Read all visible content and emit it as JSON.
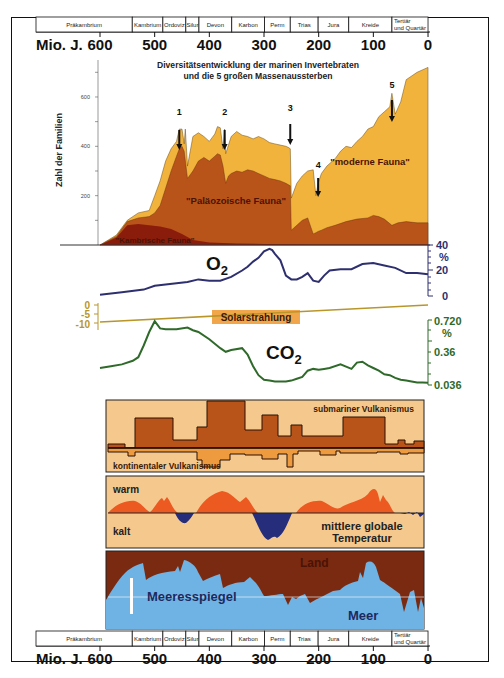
{
  "time_axis": {
    "unit_label": "Mio. J.",
    "ticks": [
      600,
      500,
      400,
      300,
      200,
      100,
      0
    ],
    "periods": [
      {
        "name": "Präkambrium",
        "from": 700,
        "to": 541
      },
      {
        "name": "Kambrium",
        "from": 541,
        "to": 485
      },
      {
        "name": "Ordoviz",
        "from": 485,
        "to": 443
      },
      {
        "name": "Silur",
        "from": 443,
        "to": 419
      },
      {
        "name": "Devon",
        "from": 419,
        "to": 359
      },
      {
        "name": "Karbon",
        "from": 359,
        "to": 299
      },
      {
        "name": "Perm",
        "from": 299,
        "to": 252
      },
      {
        "name": "Trias",
        "from": 252,
        "to": 201
      },
      {
        "name": "Jura",
        "from": 201,
        "to": 145
      },
      {
        "name": "Kreide",
        "from": 145,
        "to": 66
      },
      {
        "name": "Tertiär und Quartär",
        "line1": "Tertiär",
        "line2": "und Quartär",
        "from": 66,
        "to": 0
      }
    ]
  },
  "diversity": {
    "title_line1": "Diversitätsentwicklung der marinen Invertebraten",
    "title_line2": "und die 5 großen Massenaussterben",
    "ylabel": "Zahl der Familien",
    "yticks": [
      200,
      400,
      600
    ],
    "extinctions": [
      {
        "label": "1",
        "age": 444
      },
      {
        "label": "2",
        "age": 372
      },
      {
        "label": "3",
        "age": 252
      },
      {
        "label": "4",
        "age": 201
      },
      {
        "label": "5",
        "age": 66
      }
    ],
    "labels": {
      "cambrian": "\"Kambrische Fauna\"",
      "paleozoic": "\"Paläozoische Fauna\"",
      "modern": "\"moderne Fauna\""
    },
    "colors": {
      "cambrian": "#8a1c0c",
      "paleozoic": "#b8531a",
      "modern": "#f2b33d"
    }
  },
  "chart_data": [
    {
      "type": "area",
      "title": "Diversitätsentwicklung der marinen Invertebraten und die 5 großen Massenaussterben",
      "xlabel": "Mio. J.",
      "ylabel": "Zahl der Familien",
      "xlim": [
        600,
        0
      ],
      "ylim": [
        0,
        750
      ],
      "series": [
        {
          "name": "Kambrische Fauna",
          "x": [
            600,
            570,
            550,
            530,
            510,
            490,
            470,
            450,
            430,
            400,
            350,
            300,
            252,
            200,
            100,
            0
          ],
          "values": [
            0,
            30,
            80,
            85,
            80,
            75,
            65,
            45,
            20,
            10,
            6,
            4,
            3,
            2,
            2,
            2
          ]
        },
        {
          "name": "Kambrische + Paläozoische Fauna",
          "x": [
            600,
            570,
            550,
            530,
            510,
            500,
            490,
            480,
            470,
            460,
            455,
            450,
            446,
            440,
            430,
            420,
            410,
            400,
            390,
            385,
            380,
            375,
            370,
            365,
            360,
            350,
            340,
            330,
            320,
            310,
            300,
            290,
            280,
            270,
            260,
            252,
            250,
            240,
            230,
            220,
            210,
            205,
            201,
            195,
            185,
            170,
            150,
            130,
            110,
            100,
            90,
            80,
            66,
            55,
            40,
            20,
            0
          ],
          "values": [
            0,
            35,
            95,
            110,
            115,
            130,
            160,
            230,
            300,
            360,
            390,
            400,
            380,
            270,
            300,
            340,
            355,
            340,
            360,
            370,
            365,
            320,
            250,
            280,
            290,
            300,
            295,
            305,
            300,
            290,
            280,
            270,
            265,
            260,
            250,
            240,
            60,
            80,
            100,
            110,
            45,
            50,
            55,
            60,
            70,
            80,
            95,
            105,
            110,
            120,
            115,
            105,
            80,
            90,
            95,
            90,
            90
          ]
        },
        {
          "name": "Gesamt (inkl. moderne Fauna)",
          "x": [
            600,
            570,
            550,
            530,
            510,
            500,
            490,
            480,
            470,
            460,
            455,
            450,
            446,
            444,
            440,
            430,
            420,
            410,
            400,
            390,
            385,
            380,
            375,
            372,
            370,
            360,
            350,
            340,
            330,
            320,
            310,
            300,
            290,
            280,
            270,
            260,
            255,
            252,
            250,
            240,
            230,
            220,
            210,
            205,
            201,
            195,
            185,
            170,
            160,
            150,
            140,
            130,
            120,
            110,
            100,
            90,
            80,
            70,
            66,
            60,
            50,
            40,
            20,
            0
          ],
          "values": [
            0,
            40,
            100,
            130,
            140,
            200,
            260,
            340,
            390,
            420,
            470,
            470,
            410,
            470,
            320,
            440,
            455,
            440,
            420,
            450,
            480,
            475,
            390,
            470,
            370,
            440,
            460,
            445,
            440,
            430,
            440,
            430,
            415,
            410,
            405,
            400,
            395,
            390,
            190,
            250,
            280,
            300,
            305,
            200,
            250,
            290,
            320,
            350,
            380,
            400,
            395,
            420,
            440,
            470,
            480,
            520,
            540,
            560,
            615,
            530,
            580,
            670,
            700,
            720
          ]
        }
      ]
    },
    {
      "type": "line",
      "title": "O2",
      "xlabel": "Mio. J.",
      "ylabel": "%",
      "yticks": [
        0,
        20,
        40
      ],
      "ylim": [
        0,
        40
      ],
      "x": [
        600,
        560,
        520,
        500,
        480,
        460,
        440,
        420,
        400,
        380,
        360,
        340,
        330,
        320,
        310,
        300,
        290,
        285,
        280,
        270,
        260,
        250,
        240,
        230,
        220,
        210,
        200,
        190,
        180,
        160,
        140,
        120,
        100,
        80,
        60,
        40,
        20,
        0
      ],
      "values": [
        1,
        3,
        5,
        8,
        9,
        10,
        11,
        13,
        12,
        12,
        15,
        20,
        23,
        27,
        30,
        35,
        37,
        36,
        33,
        28,
        16,
        13,
        13,
        15,
        18,
        12,
        11,
        16,
        20,
        21,
        21,
        25,
        26,
        24,
        22,
        18,
        18,
        17
      ]
    },
    {
      "type": "line",
      "title": "Solarstrahlung",
      "ylabel": "",
      "yticks": [
        0,
        -5,
        -10
      ],
      "ylim": [
        -12,
        1
      ],
      "x": [
        600,
        0
      ],
      "values": [
        -7,
        0
      ]
    },
    {
      "type": "line",
      "title": "CO2",
      "ylabel": "%",
      "yticks": [
        0.036,
        0.36,
        0.72
      ],
      "ylim": [
        0,
        0.75
      ],
      "x": [
        600,
        580,
        560,
        540,
        530,
        520,
        510,
        500,
        490,
        480,
        460,
        440,
        430,
        420,
        400,
        380,
        370,
        360,
        340,
        330,
        320,
        310,
        300,
        290,
        280,
        270,
        260,
        250,
        240,
        230,
        220,
        210,
        200,
        190,
        180,
        160,
        140,
        130,
        120,
        110,
        100,
        90,
        80,
        70,
        60,
        50,
        40,
        30,
        20,
        10,
        0
      ],
      "values": [
        0.2,
        0.22,
        0.24,
        0.28,
        0.32,
        0.45,
        0.6,
        0.72,
        0.64,
        0.63,
        0.63,
        0.65,
        0.62,
        0.6,
        0.52,
        0.42,
        0.38,
        0.4,
        0.42,
        0.35,
        0.22,
        0.12,
        0.07,
        0.06,
        0.05,
        0.05,
        0.05,
        0.06,
        0.08,
        0.1,
        0.17,
        0.19,
        0.18,
        0.19,
        0.2,
        0.24,
        0.19,
        0.26,
        0.27,
        0.23,
        0.2,
        0.17,
        0.13,
        0.12,
        0.09,
        0.07,
        0.06,
        0.05,
        0.04,
        0.04,
        0.036
      ]
    }
  ],
  "o2_panel": {
    "label": "O",
    "subscript": "2",
    "unit": "%",
    "ticks": [
      "40",
      "20",
      "0"
    ],
    "color": "#2e2f6e"
  },
  "solar_panel": {
    "label": "Solarstrahlung",
    "ticks": [
      "0",
      "-5",
      "-10"
    ],
    "color": "#b8962a",
    "label_bg": "#f2a64c"
  },
  "co2_panel": {
    "label": "CO",
    "subscript": "2",
    "unit": "%",
    "ticks": [
      "0.720",
      "0.36",
      "0.036"
    ],
    "color": "#2f6a2a"
  },
  "volcanism_panel": {
    "submarine_label": "submariner Vulkanismus",
    "continental_label": "kontinentaler Vulkanismus",
    "bg": "#f5c98e",
    "fill_dark": "#b8531a",
    "fill_light": "#ee9a3e"
  },
  "temperature_panel": {
    "warm_label": "warm",
    "cold_label": "kalt",
    "caption_line1": "mittlere globale",
    "caption_line2": "Temperatur",
    "bg": "#f5c98e",
    "warm_color": "#ec5a22",
    "cold_color": "#262d7a"
  },
  "sea_level_panel": {
    "land_label": "Land",
    "sea_label": "Meer",
    "caption": "Meeresspiegel",
    "land_color": "#7a2a10",
    "sea_color": "#6fb2e4"
  }
}
